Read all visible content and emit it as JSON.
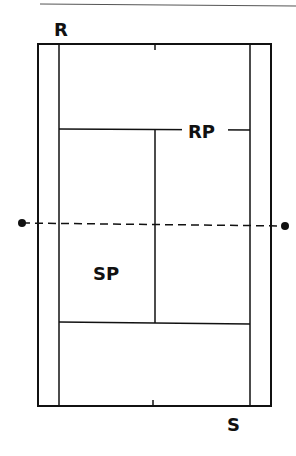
{
  "diagram": {
    "type": "tennis-court-top-view",
    "labels": {
      "receiver": "R",
      "server": "S",
      "receiver_partner": "RP",
      "server_partner": "SP"
    },
    "colors": {
      "line": "#111111",
      "background": "#ffffff",
      "header_rule": "#555555"
    },
    "elements": {
      "net": "dashed line with post dots",
      "court": "doubles court with singles sidelines, service boxes and center marks"
    }
  }
}
